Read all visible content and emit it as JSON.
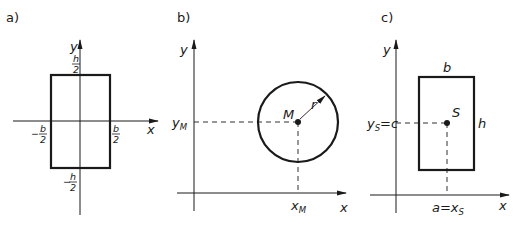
{
  "panels": [
    {
      "id": "a",
      "label": "a)",
      "x_axis": "x",
      "y_axis": "y",
      "labels": {
        "top": {
          "num": "h",
          "den": "2"
        },
        "bottom": {
          "neg": "−",
          "num": "h",
          "den": "2"
        },
        "left": {
          "neg": "−",
          "num": "b",
          "den": "2"
        },
        "right": {
          "num": "b",
          "den": "2"
        }
      },
      "shape": "rectangle centered at origin"
    },
    {
      "id": "b",
      "label": "b)",
      "x_axis": "x",
      "y_axis": "y",
      "center": "M",
      "radius": "r",
      "x_coord": "x",
      "x_coord_sub": "M",
      "y_coord": "y",
      "y_coord_sub": "M",
      "shape": "circle"
    },
    {
      "id": "c",
      "label": "c)",
      "x_axis": "x",
      "y_axis": "y",
      "centroid": "S",
      "width": "b",
      "height": "h",
      "y_coord_label": "y",
      "y_coord_sub": "S",
      "y_coord_eq": "=c",
      "x_coord_pre": "a=x",
      "x_coord_sub": "S",
      "shape": "rectangle offset from origin"
    }
  ]
}
